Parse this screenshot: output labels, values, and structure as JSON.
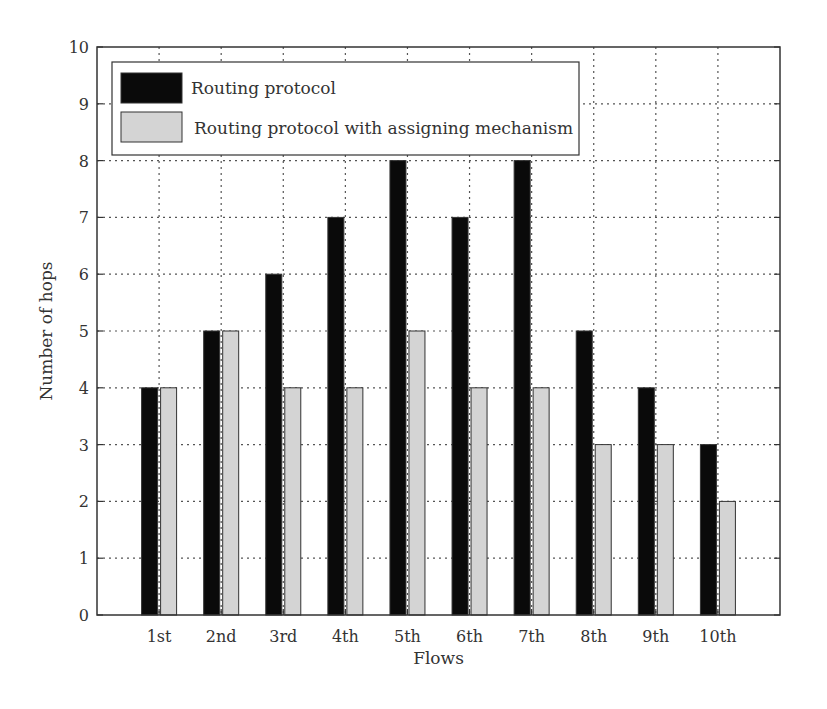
{
  "chart_data": {
    "type": "bar",
    "title": "",
    "xlabel": "Flows",
    "ylabel": "Number of hops",
    "categories": [
      "1st",
      "2nd",
      "3rd",
      "4th",
      "5th",
      "6th",
      "7th",
      "8th",
      "9th",
      "10th"
    ],
    "series": [
      {
        "name": "Routing protocol",
        "color": "#0a0a0a",
        "values": [
          4,
          5,
          6,
          7,
          8,
          7,
          8,
          5,
          4,
          3
        ]
      },
      {
        "name": "Routing protocol with assigning mechanism",
        "color": "#d4d4d4",
        "values": [
          4,
          5,
          4,
          4,
          5,
          4,
          4,
          3,
          3,
          2
        ]
      }
    ],
    "ylim": [
      0,
      10
    ],
    "yticks": [
      0,
      1,
      2,
      3,
      4,
      5,
      6,
      7,
      8,
      9,
      10
    ],
    "grid": true,
    "grid_style": "dotted",
    "legend_position": "upper left"
  },
  "colors": {
    "axis": "#333333",
    "grid": "#555555",
    "legend_border": "#333333"
  }
}
